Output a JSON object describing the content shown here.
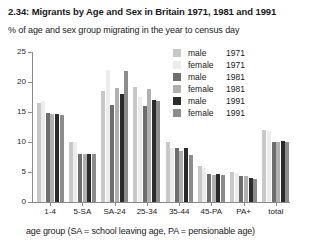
{
  "figure": {
    "title": "2.34: Migrants by Age and Sex in Britain 1971, 1981 and 1991",
    "subtitle": "% of age and sex group migrating in the year to census day",
    "footer": "age group (SA = school leaving age, PA = pensionable age)"
  },
  "legend": {
    "position": "inside-top-right",
    "items": [
      {
        "sex": "male",
        "year": "1971",
        "color": "#c8c8c8"
      },
      {
        "sex": "female",
        "year": "1971",
        "color": "#ececec"
      },
      {
        "sex": "male",
        "year": "1981",
        "color": "#6e6e6e"
      },
      {
        "sex": "female",
        "year": "1981",
        "color": "#b0b0b0"
      },
      {
        "sex": "male",
        "year": "1991",
        "color": "#2b2b2b"
      },
      {
        "sex": "female",
        "year": "1991",
        "color": "#8c8c8c"
      }
    ]
  },
  "axes": {
    "y_ticks": [
      "0",
      "5",
      "10",
      "15",
      "20",
      "25"
    ],
    "y_min": 0,
    "y_max": 25,
    "x_label": "age group"
  },
  "chart_data": {
    "type": "bar",
    "title": "2.34: Migrants by Age and Sex in Britain 1971, 1981 and 1991",
    "subtitle": "% of age and sex group migrating in the year to census day",
    "xlabel": "age group (SA = school leaving age, PA = pensionable age)",
    "ylabel": "% of age and sex group migrating in the year to census day",
    "ylim": [
      0,
      25
    ],
    "ytickstep": 5,
    "grid": false,
    "legend_position": "upper right",
    "categories": [
      "1-4",
      "5-SA",
      "SA-24",
      "25-34",
      "35-44",
      "45-PA",
      "PA+",
      "total"
    ],
    "series": [
      {
        "name": "male 1971",
        "color": "#c8c8c8",
        "values": [
          16.5,
          10.0,
          18.5,
          19.2,
          10.0,
          6.0,
          5.0,
          12.0
        ]
      },
      {
        "name": "female 1971",
        "color": "#ececec",
        "values": [
          16.8,
          10.0,
          22.0,
          17.5,
          9.0,
          5.6,
          4.8,
          11.8
        ]
      },
      {
        "name": "male 1981",
        "color": "#6e6e6e",
        "values": [
          14.8,
          8.0,
          16.2,
          16.0,
          9.0,
          4.7,
          4.3,
          10.0
        ]
      },
      {
        "name": "female 1981",
        "color": "#b0b0b0",
        "values": [
          14.6,
          8.0,
          19.0,
          18.8,
          8.5,
          4.5,
          4.4,
          10.0
        ]
      },
      {
        "name": "male 1991",
        "color": "#2b2b2b",
        "values": [
          14.7,
          8.0,
          18.0,
          17.0,
          9.0,
          4.6,
          4.0,
          10.1
        ]
      },
      {
        "name": "female 1991",
        "color": "#8c8c8c",
        "values": [
          14.5,
          8.0,
          21.8,
          16.8,
          7.8,
          4.5,
          3.8,
          10.0
        ]
      }
    ]
  }
}
